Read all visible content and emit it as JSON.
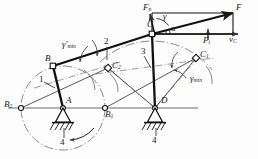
{
  "figure": {
    "type": "four-bar linkage mechanism with force decomposition",
    "labels": {
      "joint_B": "B",
      "joint_A": "A",
      "joint_C": "C",
      "joint_D": "D",
      "pos_B1": "B",
      "pos_B1_sub": "1",
      "pos_B2": "B",
      "pos_B2_sub": "2",
      "pos_C1": "C",
      "pos_C1_sub": "1",
      "pos_C2": "C",
      "pos_C2_sub": "2",
      "link_1": "1",
      "link_2": "2",
      "link_3": "3",
      "ground_left": "4",
      "ground_right": "4",
      "force_F": "F",
      "force_Fn": "F",
      "force_Fn_sub": "n",
      "force_Ft": "F",
      "force_Ft_sub": "t",
      "velocity_vC": "v",
      "velocity_vC_sub": "C",
      "angle_gamma": "γ",
      "angle_alpha": "α",
      "gamma_min_left": "γ'",
      "gamma_min_left_sub": "min",
      "gamma_min_right": "γ",
      "gamma_min_right_sub": "min"
    },
    "colors": {
      "line": "#1a1a1a",
      "construction": "#555555",
      "axis": "#888888",
      "background": "#fdfdfd"
    },
    "geometry": {
      "A": [
        63,
        108
      ],
      "B": [
        53,
        66
      ],
      "C": [
        152,
        34
      ],
      "D": [
        155,
        108
      ],
      "B1": [
        105,
        108
      ],
      "B2": [
        21,
        108
      ],
      "C1": [
        196,
        58
      ],
      "C2": [
        108,
        68
      ],
      "F_tip": [
        233,
        13
      ],
      "crank_radius": 42,
      "rocker_radius": 76
    }
  }
}
